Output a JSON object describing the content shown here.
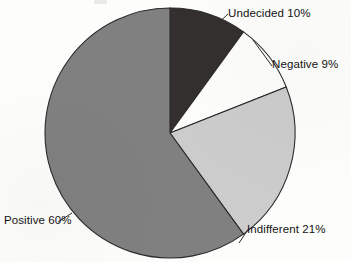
{
  "chart_data": {
    "type": "pie",
    "title": "",
    "xlabel": "",
    "ylabel": "",
    "legend_position": "outside-labels",
    "grid": false,
    "start_angle_deg": 0,
    "direction": "clockwise",
    "categories": [
      "Undecided",
      "Negative",
      "Indifferent",
      "Positive"
    ],
    "values": [
      10,
      9,
      21,
      60
    ],
    "unit": "%",
    "labels": [
      {
        "name": "undecided",
        "text": "Undecided 10%",
        "value": 10,
        "color": "#332f2e"
      },
      {
        "name": "negative",
        "text": "Negative 9%",
        "value": 9,
        "color": "#fdfdfb"
      },
      {
        "name": "indifferent",
        "text": "Indifferent 21%",
        "value": 21,
        "color": "#cccccc"
      },
      {
        "name": "positive",
        "text": "Positive 60%",
        "value": 60,
        "color": "#808080"
      }
    ],
    "colors": {
      "undecided": "#332f2e",
      "negative": "#fdfdfb",
      "indifferent": "#cccccc",
      "positive": "#808080",
      "outline": "#2b2b2b",
      "background": "#fdfdfb"
    }
  },
  "figure": {
    "center_x": 170,
    "center_y": 133,
    "radius": 125
  }
}
